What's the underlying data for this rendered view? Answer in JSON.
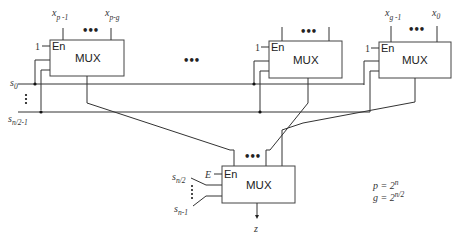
{
  "diagram": {
    "type": "multiplexer tree",
    "first_level_muxes": [
      {
        "id": "mux-left",
        "label": "MUX",
        "enable": "En",
        "enable_value": "1",
        "inputs_top": [
          "x_{p-1}",
          "x_{p-g}"
        ]
      },
      {
        "id": "mux-middle",
        "label": "MUX",
        "enable": "En",
        "enable_value": "1",
        "inputs_top": [
          "",
          ""
        ]
      },
      {
        "id": "mux-right",
        "label": "MUX",
        "enable": "En",
        "enable_value": "1",
        "inputs_top": [
          "x_{g-1}",
          "x_0"
        ]
      }
    ],
    "second_level_mux": {
      "label": "MUX",
      "enable": "En",
      "enable_value": "E",
      "select_top": "s_{n/2}",
      "select_bottom": "s_{n-1}",
      "output": "z"
    },
    "select_bus": {
      "top": "s_0",
      "bottom": "s_{n/2-1}"
    },
    "ellipsis": "•••",
    "equations": [
      "p = 2^n",
      "g = 2^{n/2}"
    ]
  },
  "labels": {
    "mux": "MUX",
    "en": "En",
    "one": "1",
    "E": "E",
    "dash": "—",
    "x": "x",
    "sub_p1": "p -1",
    "sub_pg": "p-g",
    "sub_g1": "g -1",
    "sub_0": "0",
    "s": "s",
    "sub_n2": "n/2",
    "sub_n1": "n-1",
    "sub_n21": "n/2-1",
    "z": "z",
    "ellipsis_h": "•••",
    "eq_p_lhs": "p = 2",
    "eq_p_exp": "n",
    "eq_g_lhs": "g = 2",
    "eq_g_exp": "n/2"
  }
}
